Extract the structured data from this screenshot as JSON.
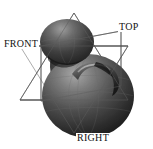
{
  "viewport": {
    "name": "3d-model-viewport",
    "width": 153,
    "height": 149,
    "background_color": "#ffffff",
    "render_mode": "shaded-with-wireframe-planes"
  },
  "labels": {
    "front": "FRONT",
    "top": "TOP",
    "right": "RIGHT"
  },
  "colors": {
    "background": "#ffffff",
    "wireframe": "#3a3a3a",
    "model_light": "#b9b9b9",
    "model_mid": "#6e6e6e",
    "model_dark": "#2b2b2b",
    "model_shadow": "#141414",
    "label_text": "#111111"
  },
  "model": {
    "name": "organic-blob-solid",
    "parts": [
      {
        "name": "body-sphere",
        "shape": "sphere"
      },
      {
        "name": "head-lobe",
        "shape": "ellipsoid"
      },
      {
        "name": "neck",
        "shape": "tapered-cylinder"
      },
      {
        "name": "handle-spout",
        "shape": "torus-arc"
      }
    ]
  },
  "view_planes": [
    {
      "name": "front-plane",
      "label": "FRONT",
      "orientation": "front"
    },
    {
      "name": "top-plane",
      "label": "TOP",
      "orientation": "top"
    },
    {
      "name": "right-plane",
      "label": "RIGHT",
      "orientation": "right"
    }
  ]
}
